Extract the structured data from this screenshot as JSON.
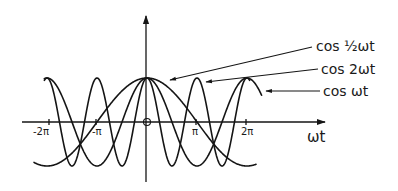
{
  "diagram": {
    "title": "",
    "axes": {
      "x_label": "ωt",
      "y_label": "",
      "origin_label": "O",
      "x_ticks": [
        {
          "label": "-2π",
          "value": -6.2832
        },
        {
          "label": "-π",
          "value": -3.1416
        },
        {
          "label": "π",
          "value": 3.1416
        },
        {
          "label": "2π",
          "value": 6.2832
        }
      ]
    },
    "curves": [
      {
        "name": "cos-half-omega-t",
        "label": "cos ½ωt",
        "frequency_factor": 0.5
      },
      {
        "name": "cos-2-omega-t",
        "label": "cos 2ωt",
        "frequency_factor": 2
      },
      {
        "name": "cos-omega-t",
        "label": "cos ωt",
        "frequency_factor": 1
      }
    ],
    "colors": {
      "ink": "#151515",
      "background": "#ffffff"
    }
  }
}
